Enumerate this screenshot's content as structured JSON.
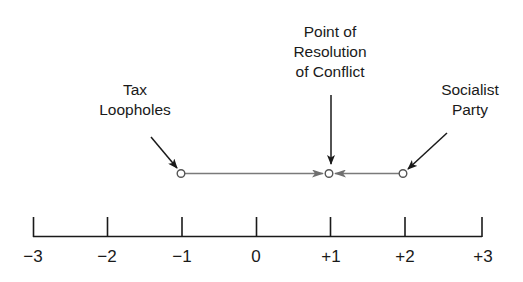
{
  "diagram": {
    "type": "number-line",
    "annotations": [
      {
        "id": "tax",
        "text": "Tax\nLoopholes",
        "value": -1
      },
      {
        "id": "resolution",
        "text": "Point of\nResolution\nof Conflict",
        "value": 1
      },
      {
        "id": "socialist",
        "text": "Socialist\nParty",
        "value": 2
      }
    ],
    "axis": {
      "min": -3,
      "max": 3,
      "ticks": [
        "−3",
        "−2",
        "−1",
        "0",
        "+1",
        "+2",
        "+3"
      ]
    }
  },
  "labels": {
    "tax": "Tax\nLoopholes",
    "resolution": "Point of\nResolution\nof Conflict",
    "socialist": "Socialist\nParty"
  },
  "ticks": [
    "−3",
    "−2",
    "−1",
    "0",
    "+1",
    "+2",
    "+3"
  ],
  "colors": {
    "line": "#1a1a1a",
    "connector": "#7a7a7a"
  }
}
